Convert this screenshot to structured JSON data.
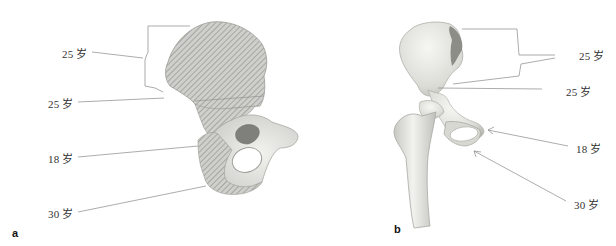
{
  "figure": {
    "panels": [
      {
        "id": "a",
        "panel_label": "a",
        "view": "hip bone (os coxae), lateral view with hatched ossification regions",
        "labels": [
          {
            "text": "25 岁",
            "target": "iliac crest (epiphysis)"
          },
          {
            "text": "25 岁",
            "target": "anterior inferior iliac spine"
          },
          {
            "text": "18 岁",
            "target": "ischial spine / acetabulum region"
          },
          {
            "text": "30 岁",
            "target": "ischial tuberosity"
          }
        ]
      },
      {
        "id": "b",
        "panel_label": "b",
        "view": "hip bone with proximal femur, anterior view",
        "labels": [
          {
            "text": "25 岁",
            "target": "iliac crest (epiphysis)"
          },
          {
            "text": "25 岁",
            "target": "anterior inferior iliac spine"
          },
          {
            "text": "18 岁",
            "target": "pubic tubercle region"
          },
          {
            "text": "30 岁",
            "target": "ischial tuberosity"
          }
        ]
      }
    ],
    "colors": {
      "bone_fill": "#e8e8e4",
      "bone_shade": "#b5b5b0",
      "hatch": "#8a8a86",
      "leader_line": "#888888",
      "text": "#333333"
    }
  }
}
